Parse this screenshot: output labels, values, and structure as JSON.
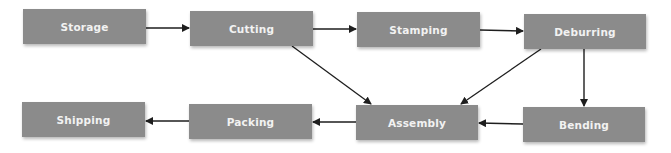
{
  "diagram": {
    "type": "process-flow",
    "colors": {
      "node_fill": "#8b8b8b",
      "node_text": "#f2f2f2",
      "edge": "#1e1e1e",
      "background": "#ffffff"
    },
    "nodes": [
      {
        "id": "storage",
        "label": "Storage"
      },
      {
        "id": "cutting",
        "label": "Cutting"
      },
      {
        "id": "stamping",
        "label": "Stamping"
      },
      {
        "id": "deburring",
        "label": "Deburring"
      },
      {
        "id": "bending",
        "label": "Bending"
      },
      {
        "id": "assembly",
        "label": "Assembly"
      },
      {
        "id": "packing",
        "label": "Packing"
      },
      {
        "id": "shipping",
        "label": "Shipping"
      }
    ],
    "edges": [
      {
        "from": "storage",
        "to": "cutting"
      },
      {
        "from": "cutting",
        "to": "stamping"
      },
      {
        "from": "stamping",
        "to": "deburring"
      },
      {
        "from": "cutting",
        "to": "assembly"
      },
      {
        "from": "deburring",
        "to": "assembly"
      },
      {
        "from": "deburring",
        "to": "bending"
      },
      {
        "from": "bending",
        "to": "assembly"
      },
      {
        "from": "assembly",
        "to": "packing"
      },
      {
        "from": "packing",
        "to": "shipping"
      }
    ]
  }
}
